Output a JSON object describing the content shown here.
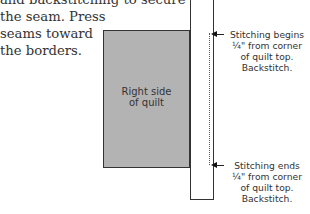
{
  "body_text": {
    "lines": [
      "and backstitching to secure",
      "the seam. Press",
      "seams toward",
      "the borders."
    ]
  },
  "diagram": {
    "quilt_label": [
      "Right side",
      "of quilt"
    ],
    "callout_top": {
      "lines": [
        "Stitching begins",
        "¼\" from corner",
        "of quilt top.",
        "Backstitch."
      ]
    },
    "callout_bottom": {
      "lines": [
        "Stitching ends",
        "¼\" from corner",
        "of quilt top.",
        "Backstitch."
      ]
    },
    "colors": {
      "quilt_fill": "#b3b3b3",
      "outline": "#333333",
      "strip_fill": "#ffffff"
    }
  }
}
